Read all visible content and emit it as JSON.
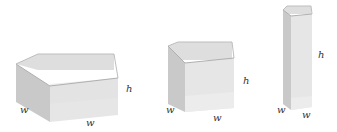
{
  "figure": {
    "boxes": [
      {
        "name": "wide-flat-box",
        "width_label": "w",
        "depth_label": "w",
        "height_label": "h"
      },
      {
        "name": "cube-box",
        "width_label": "w",
        "depth_label": "w",
        "height_label": "h"
      },
      {
        "name": "tall-narrow-box",
        "width_label": "w",
        "depth_label": "w",
        "height_label": "h"
      }
    ],
    "colors": {
      "face_light": "#e6e6e6",
      "face_mid": "#d4d4d4",
      "face_dark": "#c2c2c2",
      "edge": "#b8b8b8",
      "label": "#333333"
    }
  }
}
